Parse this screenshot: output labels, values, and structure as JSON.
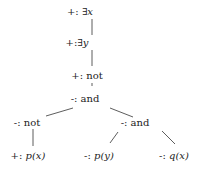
{
  "diagram": {
    "type": "tree",
    "nodes": [
      {
        "id": "n1",
        "sign": "+:",
        "label": "∃x",
        "math": true,
        "x": 80,
        "y": 12
      },
      {
        "id": "n2",
        "sign": "+:",
        "label": "∃y",
        "math": true,
        "x": 77,
        "y": 43
      },
      {
        "id": "n3",
        "sign": "+:",
        "label": "not",
        "math": false,
        "x": 87,
        "y": 76
      },
      {
        "id": "n4",
        "sign": "-:",
        "label": "and",
        "math": false,
        "x": 85,
        "y": 99
      },
      {
        "id": "n5",
        "sign": "-:",
        "label": "not",
        "math": false,
        "x": 27,
        "y": 123
      },
      {
        "id": "n6",
        "sign": "-:",
        "label": "and",
        "math": false,
        "x": 135,
        "y": 123
      },
      {
        "id": "n7",
        "sign": "+:",
        "label": "p(x)",
        "math": true,
        "x": 28,
        "y": 156
      },
      {
        "id": "n8",
        "sign": "-:",
        "label": "p(y)",
        "math": true,
        "x": 99,
        "y": 156
      },
      {
        "id": "n9",
        "sign": "-:",
        "label": "q(x)",
        "math": true,
        "x": 174,
        "y": 156
      }
    ],
    "edges": [
      {
        "from": "n1",
        "to": "n2",
        "x1": 92,
        "y1": 19,
        "x2": 92,
        "y2": 35
      },
      {
        "from": "n2",
        "to": "n3",
        "x1": 92,
        "y1": 50,
        "x2": 92,
        "y2": 66
      },
      {
        "from": "n3",
        "to": "n4",
        "x1": 92,
        "y1": 83,
        "x2": 92,
        "y2": 86
      },
      {
        "from": "n4",
        "to": "n5",
        "x1": 73,
        "y1": 108,
        "x2": 46,
        "y2": 116
      },
      {
        "from": "n4",
        "to": "n6",
        "x1": 110,
        "y1": 108,
        "x2": 133,
        "y2": 117
      },
      {
        "from": "n5",
        "to": "n7",
        "x1": 33,
        "y1": 129,
        "x2": 33,
        "y2": 146
      },
      {
        "from": "n6",
        "to": "n8",
        "x1": 118,
        "y1": 132,
        "x2": 110,
        "y2": 143
      },
      {
        "from": "n6",
        "to": "n9",
        "x1": 162,
        "y1": 131,
        "x2": 175,
        "y2": 144
      }
    ]
  }
}
